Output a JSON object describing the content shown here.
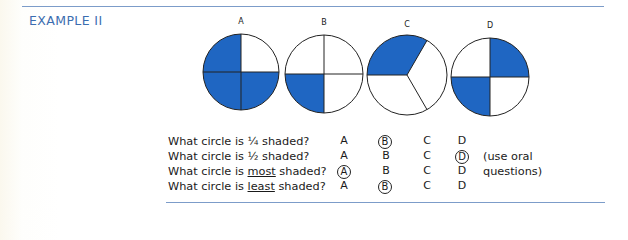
{
  "heading": "EXAMPLE II",
  "colors": {
    "accent": "#3b6db0",
    "fill": "#1f66c2",
    "rule": "#7c9cc9"
  },
  "circles": [
    {
      "label": "A",
      "divisions": 4,
      "shaded": [
        "top-left",
        "bottom-left",
        "bottom-right"
      ],
      "fraction_shaded": "3/4"
    },
    {
      "label": "B",
      "divisions": 4,
      "shaded": [
        "bottom-left"
      ],
      "fraction_shaded": "1/4"
    },
    {
      "label": "C",
      "divisions": 3,
      "shaded": [
        "upper-left third"
      ],
      "fraction_shaded": "1/3"
    },
    {
      "label": "D",
      "divisions": 4,
      "shaded": [
        "top-right",
        "bottom-left"
      ],
      "fraction_shaded": "1/2"
    }
  ],
  "questions": [
    {
      "pre": "What circle is ",
      "emph": "",
      "post": "¼ shaded?",
      "options": [
        "A",
        "B",
        "C",
        "D"
      ],
      "circled": "B"
    },
    {
      "pre": "What circle is ",
      "emph": "",
      "post": "½ shaded?",
      "options": [
        "A",
        "B",
        "C",
        "D"
      ],
      "circled": "D"
    },
    {
      "pre": "What circle is ",
      "emph": "most",
      "post": " shaded?",
      "options": [
        "A",
        "B",
        "C",
        "D"
      ],
      "circled": "A"
    },
    {
      "pre": "What circle is ",
      "emph": "least",
      "post": " shaded?",
      "options": [
        "A",
        "B",
        "C",
        "D"
      ],
      "circled": "B"
    }
  ],
  "note": {
    "line1": "(use oral",
    "line2": "questions)"
  }
}
